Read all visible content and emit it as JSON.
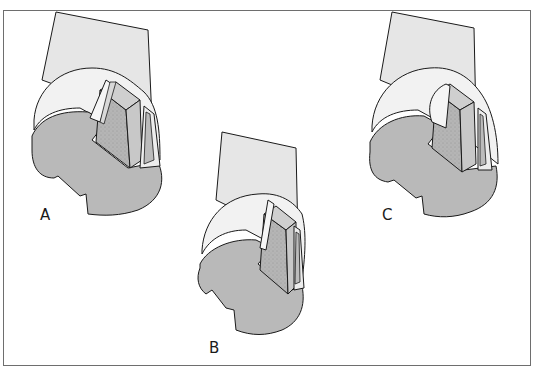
{
  "figure": {
    "type": "technical illustration",
    "colors": {
      "background": "#ffffff",
      "frame_border": "#6e6e6e",
      "shaft_fill": "#e6e6e6",
      "collar_fill": "#f2f2f2",
      "face_fill": "#b9b9b9",
      "insert_side_fill": "#c8c8c8",
      "insert_top_fill": "#cfcfcf",
      "outline": "#1a1a1a"
    },
    "panels": [
      {
        "id": "A",
        "label": "A"
      },
      {
        "id": "B",
        "label": "B"
      },
      {
        "id": "C",
        "label": "C"
      }
    ]
  }
}
